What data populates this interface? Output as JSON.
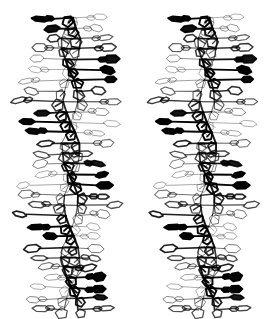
{
  "figure": {
    "kind": "stereo-pair-line-drawing",
    "background_color": "#ffffff",
    "line_color": "#000000",
    "width": 269,
    "height": 319,
    "panel_count": 2,
    "panels": [
      {
        "id": "left",
        "label": "left-eye-view",
        "x": 0,
        "y": 0,
        "width": 134,
        "height": 319,
        "parallax_shift": 0.0
      },
      {
        "id": "right",
        "label": "right-eye-view",
        "x": 135,
        "y": 0,
        "width": 134,
        "height": 319,
        "parallax_shift": 1.6
      }
    ]
  },
  "chart_data": {
    "type": "scatter",
    "title": "",
    "xlabel": "",
    "ylabel": "",
    "helix": {
      "axis_x": 66,
      "y_top": 18,
      "y_bottom": 306,
      "rise_per_base_pair": 10.4,
      "base_pairs_visible": 28,
      "turns_visible": 2.7,
      "backbone_amplitude": 15,
      "base_arm_length": 42,
      "ring_width": 15,
      "ring_height": 6.5,
      "bold_stroke": 1.9,
      "thin_stroke": 0.75,
      "phase_offset_strand_b": 3.14159
    }
  }
}
